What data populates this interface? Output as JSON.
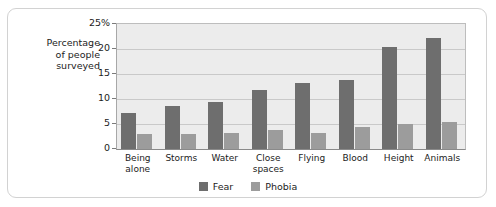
{
  "chart_data": {
    "type": "bar",
    "title": "",
    "xlabel": "",
    "ylabel": "Percentage of people surveyed",
    "ylim": [
      0,
      25
    ],
    "ytick_labels": [
      "25%",
      "20",
      "15",
      "10",
      "5",
      "0"
    ],
    "ytick_values": [
      25,
      20,
      15,
      10,
      5,
      0
    ],
    "grid": true,
    "legend_position": "bottom",
    "categories": [
      "Being alone",
      "Storms",
      "Water",
      "Close spaces",
      "Flying",
      "Blood",
      "Height",
      "Animals"
    ],
    "series": [
      {
        "name": "Fear",
        "color": "#6e6e6e",
        "values": [
          7.2,
          8.5,
          9.4,
          11.8,
          13.1,
          13.8,
          20.3,
          22.1
        ]
      },
      {
        "name": "Phobia",
        "color": "#9c9c9c",
        "values": [
          3.0,
          3.0,
          3.2,
          3.7,
          3.2,
          4.3,
          5.0,
          5.4
        ]
      }
    ]
  },
  "ylabel_lines": [
    "Percentage",
    "of people",
    "surveyed"
  ],
  "legend": {
    "items": [
      {
        "label": "Fear",
        "key": "fear"
      },
      {
        "label": "Phobia",
        "key": "phobia"
      }
    ]
  },
  "colors": {
    "fear": "#6e6e6e",
    "phobia": "#9c9c9c",
    "plot_background": "#ececec",
    "gridline": "#c9c9c9",
    "border": "#d2d2d2",
    "text": "#1c1c1c"
  }
}
